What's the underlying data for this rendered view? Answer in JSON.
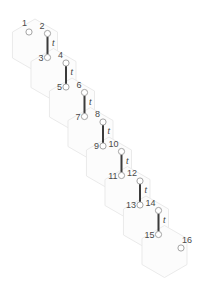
{
  "figure": {
    "kind": "hexagonal-lattice-ribbon",
    "width": 212,
    "height": 293,
    "background_color": "#ffffff"
  },
  "style": {
    "hex_fill": "#fcfcfc",
    "hex_stroke": "#e8e8e8",
    "node_fill": "#ffffff",
    "node_stroke": "#9a9a9a",
    "bond_color": "#3b3b3b",
    "label_color": "#4a4a4a",
    "symbol_color": "#3b3b3b"
  },
  "geometry": {
    "hex_radius": 26,
    "hex_count": 8,
    "step_x": 18.5,
    "step_y": 29.5,
    "origin_x": 35,
    "origin_y": 45
  },
  "hexagons": [
    {
      "id": "hex-1",
      "cx": 35,
      "cy": 45
    },
    {
      "id": "hex-2",
      "cx": 53.5,
      "cy": 74.5
    },
    {
      "id": "hex-3",
      "cx": 72,
      "cy": 104
    },
    {
      "id": "hex-4",
      "cx": 90.5,
      "cy": 133.5
    },
    {
      "id": "hex-5",
      "cx": 109,
      "cy": 163
    },
    {
      "id": "hex-6",
      "cx": 127.5,
      "cy": 192.5
    },
    {
      "id": "hex-7",
      "cx": 146,
      "cy": 222
    },
    {
      "id": "hex-8",
      "cx": 164.5,
      "cy": 251.5
    }
  ],
  "sites": [
    {
      "label": "1",
      "x": 29,
      "y": 32,
      "label_dx": -2,
      "label_dy": -6,
      "anchor": "end"
    },
    {
      "label": "2",
      "x": 47.5,
      "y": 33.5,
      "label_dx": -3,
      "label_dy": -5,
      "anchor": "end"
    },
    {
      "label": "3",
      "x": 47.5,
      "y": 57.5,
      "label_dx": -4,
      "label_dy": 3,
      "anchor": "end"
    },
    {
      "label": "4",
      "x": 66,
      "y": 63,
      "label_dx": -3,
      "label_dy": -5,
      "anchor": "end"
    },
    {
      "label": "5",
      "x": 66,
      "y": 87,
      "label_dx": -4,
      "label_dy": 3,
      "anchor": "end"
    },
    {
      "label": "6",
      "x": 84.5,
      "y": 92.5,
      "label_dx": -3,
      "label_dy": -5,
      "anchor": "end"
    },
    {
      "label": "7",
      "x": 84.5,
      "y": 116.5,
      "label_dx": -4,
      "label_dy": 3,
      "anchor": "end"
    },
    {
      "label": "8",
      "x": 103,
      "y": 122,
      "label_dx": -3,
      "label_dy": -5,
      "anchor": "end"
    },
    {
      "label": "9",
      "x": 103,
      "y": 146,
      "label_dx": -4,
      "label_dy": 3,
      "anchor": "end"
    },
    {
      "label": "10",
      "x": 121.5,
      "y": 151.5,
      "label_dx": -3,
      "label_dy": -5,
      "anchor": "end"
    },
    {
      "label": "11",
      "x": 121.5,
      "y": 175.5,
      "label_dx": -4,
      "label_dy": 3,
      "anchor": "end"
    },
    {
      "label": "12",
      "x": 140,
      "y": 181,
      "label_dx": -3,
      "label_dy": -5,
      "anchor": "end"
    },
    {
      "label": "13",
      "x": 140,
      "y": 205,
      "label_dx": -4,
      "label_dy": 3,
      "anchor": "end"
    },
    {
      "label": "14",
      "x": 158.5,
      "y": 210.5,
      "label_dx": -3,
      "label_dy": -5,
      "anchor": "end"
    },
    {
      "label": "15",
      "x": 158.5,
      "y": 234.5,
      "label_dx": -4,
      "label_dy": 3,
      "anchor": "end"
    },
    {
      "label": "16",
      "x": 181,
      "y": 248,
      "label_dx": 1,
      "label_dy": -5,
      "anchor": "start"
    }
  ],
  "bonds": [
    {
      "id": "bond-2-3",
      "from": "2",
      "to": "3",
      "x": 47.5,
      "y1": 36.5,
      "y2": 54.5,
      "symbol": "t",
      "sx": 52,
      "sy": 45.5
    },
    {
      "id": "bond-4-5",
      "from": "4",
      "to": "5",
      "x": 66,
      "y1": 66,
      "y2": 84,
      "symbol": "t",
      "sx": 70.5,
      "sy": 75
    },
    {
      "id": "bond-6-7",
      "from": "6",
      "to": "7",
      "x": 84.5,
      "y1": 95.5,
      "y2": 113.5,
      "symbol": "t",
      "sx": 89,
      "sy": 104.5
    },
    {
      "id": "bond-8-9",
      "from": "8",
      "to": "9",
      "x": 103,
      "y1": 125,
      "y2": 143,
      "symbol": "t",
      "sx": 107.5,
      "sy": 134
    },
    {
      "id": "bond-10-11",
      "from": "10",
      "to": "11",
      "x": 121.5,
      "y1": 154.5,
      "y2": 172.5,
      "symbol": "t",
      "sx": 126,
      "sy": 163.5
    },
    {
      "id": "bond-12-13",
      "from": "12",
      "to": "13",
      "x": 140,
      "y1": 184,
      "y2": 202,
      "symbol": "t",
      "sx": 144.5,
      "sy": 193
    },
    {
      "id": "bond-14-15",
      "from": "14",
      "to": "15",
      "x": 158.5,
      "y1": 213.5,
      "y2": 231.5,
      "symbol": "t",
      "sx": 163,
      "sy": 222.5
    }
  ],
  "hopping_symbol": "t",
  "site_count": 16,
  "bond_count": 7
}
